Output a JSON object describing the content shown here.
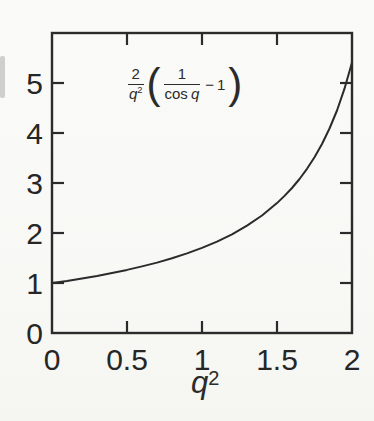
{
  "canvas": {
    "width": 374,
    "height": 421,
    "paper_color": "#fafaf8",
    "ink_color": "#2b2b2b"
  },
  "chart_data": {
    "type": "line",
    "xlabel": "q²",
    "ylabel": "",
    "xlim": [
      0,
      2
    ],
    "ylim": [
      0,
      6
    ],
    "x_ticks": [
      0,
      0.5,
      1,
      1.5,
      2
    ],
    "x_tick_labels": [
      "0",
      "0.5",
      "1",
      "1.5",
      "2"
    ],
    "y_ticks": [
      0,
      1,
      2,
      3,
      4,
      5
    ],
    "y_tick_labels": [
      "0",
      "1",
      "2",
      "3",
      "4",
      "5"
    ],
    "grid": false,
    "legend": "none",
    "frame": "closed box, ticks pointing inward on all four sides",
    "annotation": "2/q² (1/cos q − 1) shown upper-left inside plot",
    "series": [
      {
        "name": "(2/q²)(1/cos q − 1)",
        "x": [
          0,
          0.1,
          0.2,
          0.3,
          0.4,
          0.5,
          0.6,
          0.7,
          0.8,
          0.9,
          1.0,
          1.1,
          1.2,
          1.3,
          1.4,
          1.5,
          1.55,
          1.6,
          1.65,
          1.7,
          1.75,
          1.8,
          1.85,
          1.9,
          1.95,
          2.0
        ],
        "y": [
          1.0,
          1.043,
          1.091,
          1.143,
          1.202,
          1.262,
          1.331,
          1.408,
          1.494,
          1.591,
          1.702,
          1.828,
          1.975,
          2.147,
          2.35,
          2.598,
          2.741,
          2.901,
          3.08,
          3.283,
          3.514,
          3.78,
          4.089,
          4.451,
          4.886,
          5.413
        ]
      }
    ]
  },
  "formula": {
    "outer_num": "2",
    "outer_den_base": "q",
    "outer_den_sup": "2",
    "open_paren": "(",
    "inner_num": "1",
    "inner_den_fn": "cos",
    "inner_den_var": "q",
    "minus": "−",
    "one": "1",
    "close_paren": ")"
  },
  "x_axis_label": {
    "base": "q",
    "sup": "2"
  }
}
